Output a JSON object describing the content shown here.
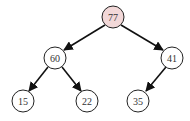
{
  "diagram": {
    "type": "binary-tree (max-heap)",
    "colors": {
      "root_fill": "#f2d8d8",
      "node_fill": "#ffffff",
      "stroke": "#222222",
      "edge": "#111111"
    },
    "nodes": [
      {
        "id": "n77",
        "label": "77",
        "cx": 113,
        "cy": 17,
        "highlight": true
      },
      {
        "id": "n60",
        "label": "60",
        "cx": 55,
        "cy": 58,
        "highlight": false
      },
      {
        "id": "n41",
        "label": "41",
        "cx": 172,
        "cy": 58,
        "highlight": false
      },
      {
        "id": "n15",
        "label": "15",
        "cx": 23,
        "cy": 101,
        "highlight": false
      },
      {
        "id": "n22",
        "label": "22",
        "cx": 87,
        "cy": 101,
        "highlight": false
      },
      {
        "id": "n35",
        "label": "35",
        "cx": 138,
        "cy": 101,
        "highlight": false
      }
    ],
    "edges": [
      {
        "from": "77",
        "to": "60"
      },
      {
        "from": "77",
        "to": "41"
      },
      {
        "from": "60",
        "to": "15"
      },
      {
        "from": "60",
        "to": "22"
      },
      {
        "from": "41",
        "to": "35"
      }
    ]
  }
}
